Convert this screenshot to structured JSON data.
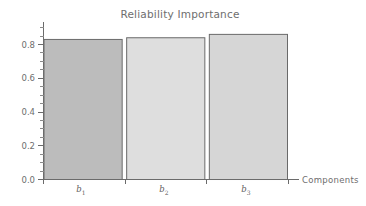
{
  "chart_data": {
    "type": "bar",
    "title": "Reliability Importance",
    "xlabel": "Components",
    "ylabel": "",
    "categories": [
      "b1",
      "b2",
      "b3"
    ],
    "category_labels": [
      "b",
      "b",
      "b"
    ],
    "category_subscripts": [
      "1",
      "2",
      "3"
    ],
    "values": [
      0.83,
      0.84,
      0.86
    ],
    "value_labels": [
      "0.83",
      "0.84",
      "0.86"
    ],
    "ylim": [
      0.0,
      0.93
    ],
    "xlim": [
      0,
      3
    ],
    "y_ticks": [
      0.0,
      0.2,
      0.4,
      0.6,
      0.8
    ],
    "y_tick_labels": [
      "0.0",
      "0.2",
      "0.4",
      "0.6",
      "0.8"
    ],
    "y_minor_tick_step": 0.05,
    "grid": false,
    "legend": false,
    "legend_position": "none",
    "bar_colors": [
      "#bcbcbc",
      "#dedede",
      "#d6d6d6"
    ],
    "bar_edge_color": "#6a6a6a",
    "axis_color": "#6b6b6b",
    "text_color": "#6e6e6e",
    "background_color": "#ffffff"
  },
  "axes": {
    "y_tick_0": "0.0",
    "y_tick_1": "0.2",
    "y_tick_2": "0.4",
    "y_tick_3": "0.6",
    "y_tick_4": "0.8",
    "x_axis_name": "Components"
  },
  "bars": [
    {
      "label": "b",
      "sub": "1",
      "value": "0.83"
    },
    {
      "label": "b",
      "sub": "2",
      "value": "0.84"
    },
    {
      "label": "b",
      "sub": "3",
      "value": "0.86"
    }
  ],
  "title": {
    "text": "Reliability Importance"
  }
}
